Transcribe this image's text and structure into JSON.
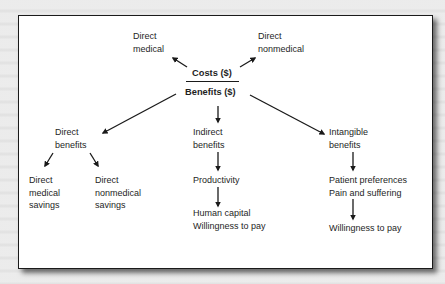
{
  "diagram": {
    "center": {
      "numerator": "Costs ($)",
      "denominator": "Benefits ($)"
    },
    "costs": [
      {
        "label": "Direct\nmedical"
      },
      {
        "label": "Direct\nnonmedical"
      }
    ],
    "benefits": [
      {
        "label": "Direct\nbenefits",
        "children": [
          {
            "label": "Direct\nmedical\nsavings"
          },
          {
            "label": "Direct\nnonmedical\nsavings"
          }
        ]
      },
      {
        "label": "Indirect\nbenefits",
        "chain": [
          {
            "label": "Productivity"
          },
          {
            "label": "Human capital\nWillingness to pay"
          }
        ]
      },
      {
        "label": "Intangible\nbenefits",
        "chain": [
          {
            "label": "Patient preferences\nPain and suffering"
          },
          {
            "label": "Willingness to pay"
          }
        ]
      }
    ],
    "colors": {
      "panel_bg": "#ffffff",
      "text": "#1e1e1e",
      "border": "#1a1a1a",
      "page_bg": "#e9e9e9"
    }
  }
}
